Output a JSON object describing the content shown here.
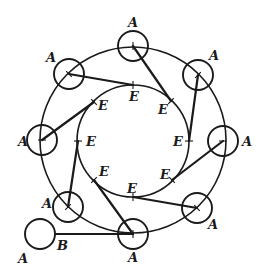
{
  "diagram": {
    "stroke_color": "#1a1a1a",
    "background": "#ffffff",
    "outer_circle": {
      "cx": 133,
      "cy": 140,
      "r": 93
    },
    "inner_circle": {
      "cx": 133,
      "cy": 141,
      "r": 56
    },
    "node_radius": 15,
    "nodes": [
      {
        "id": "n-top",
        "label": "A",
        "cx": 133,
        "cy": 46,
        "lx": 128,
        "ly": 27
      },
      {
        "id": "n-upper-right",
        "label": "A",
        "cx": 198,
        "cy": 75,
        "lx": 209,
        "ly": 60
      },
      {
        "id": "n-right",
        "label": "A",
        "cx": 223,
        "cy": 141,
        "lx": 242,
        "ly": 146
      },
      {
        "id": "n-lower-right",
        "label": "A",
        "cx": 197,
        "cy": 208,
        "lx": 208,
        "ly": 229
      },
      {
        "id": "n-bottom",
        "label": "A",
        "cx": 133,
        "cy": 234,
        "lx": 128,
        "ly": 262
      },
      {
        "id": "n-lower-left",
        "label": "A",
        "cx": 68,
        "cy": 207,
        "lx": 42,
        "ly": 208
      },
      {
        "id": "n-left",
        "label": "A",
        "cx": 42,
        "cy": 140,
        "lx": 18,
        "ly": 146
      },
      {
        "id": "n-upper-left",
        "label": "A",
        "cx": 69,
        "cy": 74,
        "lx": 46,
        "ly": 62
      }
    ],
    "inner_points": [
      {
        "id": "e-top",
        "label": "E",
        "x": 133,
        "y": 85,
        "lx": 129,
        "ly": 101
      },
      {
        "id": "e-upper-right",
        "label": "E",
        "x": 171,
        "y": 101,
        "lx": 158,
        "ly": 114
      },
      {
        "id": "e-right",
        "label": "E",
        "x": 189,
        "y": 141,
        "lx": 173,
        "ly": 146
      },
      {
        "id": "e-lower-right",
        "label": "E",
        "x": 172,
        "y": 180,
        "lx": 160,
        "ly": 179
      },
      {
        "id": "e-bottom",
        "label": "E",
        "x": 133,
        "y": 197,
        "lx": 127,
        "ly": 193
      },
      {
        "id": "e-lower-left",
        "label": "E",
        "x": 94,
        "y": 180,
        "lx": 99,
        "ly": 176
      },
      {
        "id": "e-left",
        "label": "E",
        "x": 78,
        "y": 141,
        "lx": 86,
        "ly": 146
      },
      {
        "id": "e-upper-left",
        "label": "E",
        "x": 94,
        "y": 102,
        "lx": 98,
        "ly": 110
      }
    ],
    "connections": [
      {
        "from": "n-upper-left",
        "to": "e-top"
      },
      {
        "from": "n-top",
        "to": "e-upper-right"
      },
      {
        "from": "n-upper-right",
        "to": "e-right"
      },
      {
        "from": "n-right",
        "to": "e-lower-right"
      },
      {
        "from": "n-lower-right",
        "to": "e-bottom"
      },
      {
        "from": "n-bottom",
        "to": "e-lower-left"
      },
      {
        "from": "n-lower-left",
        "to": "e-left"
      },
      {
        "from": "n-left",
        "to": "e-upper-left"
      }
    ],
    "detached": {
      "circle": {
        "label": "A",
        "cx": 40,
        "cy": 234,
        "r": 15,
        "lx": 18,
        "ly": 263
      },
      "point": {
        "label": "B",
        "x": 55,
        "y": 234,
        "lx": 57,
        "ly": 250
      },
      "connects_to": "n-bottom"
    }
  }
}
